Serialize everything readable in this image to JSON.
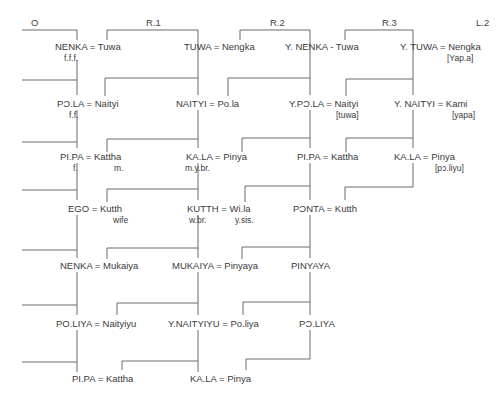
{
  "headers": {
    "o": "O",
    "r1": "R.1",
    "r2": "R.2",
    "r3": "R.3",
    "l2": "L.2"
  },
  "columns": {
    "col0": [
      {
        "label": "NENKA = Tuwa",
        "sub": "f.f.f."
      },
      {
        "label": "PƆ.LA = Naityi",
        "sub": "f.f."
      },
      {
        "label": "PI.PA = Kattha",
        "sub": "f.",
        "sub2": "m."
      },
      {
        "label": "EGO = Kutth",
        "sub": "wife"
      },
      {
        "label": "NENKA = Mukaiya"
      },
      {
        "label": "PO.LIYA = Naityiyu"
      },
      {
        "label": "PI.PA = Kattha"
      }
    ],
    "col1": [
      {
        "label": "TUWA = Nengka"
      },
      {
        "label": "NAITYI = Po.la"
      },
      {
        "label": "KA.LA = Pinya",
        "sub": "m.y.br."
      },
      {
        "label": "KUTTH = Wi.la",
        "sub": "w.br.",
        "sub2": "y.sis."
      },
      {
        "label": "MUKAIYA = Pinyaya"
      },
      {
        "label": "Y.NAITYIYU = Po.liya"
      },
      {
        "label": "KA.LA = Pinya"
      }
    ],
    "col2": [
      {
        "label": "Y. NENKA - Tuwa"
      },
      {
        "label": "Y.PƆ.LA = Naityi",
        "sub": "[tuwa]"
      },
      {
        "label": "PI.PA = Kattha"
      },
      {
        "label": "PƆNTA = Kutth"
      },
      {
        "label": "PINYAYA"
      },
      {
        "label": "PƆ.LIYA"
      }
    ],
    "col3": [
      {
        "label": "Y. TUWA = Nengka",
        "sub": "[Yap.a]"
      },
      {
        "label": "Y. NAITYI = Kami",
        "sub": "[yapa]"
      },
      {
        "label": "KA.LA = Pinya",
        "sub": "[pɔ.liyu]"
      }
    ]
  },
  "colors": {
    "line": "#6b6b6b",
    "text": "#3a3a3a",
    "background": "#ffffff"
  }
}
